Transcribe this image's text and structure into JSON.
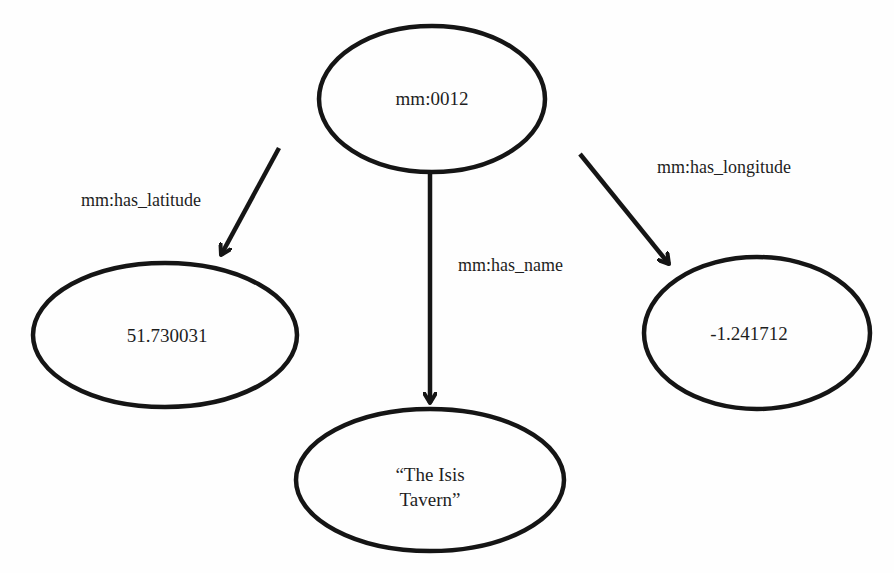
{
  "diagram": {
    "type": "rdf-graph",
    "colors": {
      "stroke": "#151515",
      "text": "#1e1e1e",
      "background": "#fefefe"
    },
    "nodes": [
      {
        "id": "subject",
        "label": "mm:0012",
        "cx": 432,
        "cy": 99,
        "rx": 113,
        "ry": 73
      },
      {
        "id": "latitude",
        "label": "51.730031",
        "cx": 165,
        "cy": 335,
        "rx": 132,
        "ry": 72
      },
      {
        "id": "longitude",
        "label": "-1.241712",
        "cx": 757,
        "cy": 333,
        "rx": 113,
        "ry": 76
      },
      {
        "id": "name",
        "label_lines": [
          "“The Isis",
          "Tavern”"
        ],
        "cx": 430,
        "cy": 480,
        "rx": 134,
        "ry": 71
      }
    ],
    "edges": [
      {
        "from": "subject",
        "to": "latitude",
        "label": "mm:has_latitude"
      },
      {
        "from": "subject",
        "to": "name",
        "label": "mm:has_name"
      },
      {
        "from": "subject",
        "to": "longitude",
        "label": "mm:has_longitude"
      }
    ]
  }
}
